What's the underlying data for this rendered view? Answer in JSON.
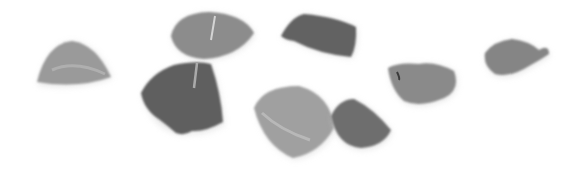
{
  "image": {
    "description": "Grayscale photo of scattered rose petals on a white background",
    "background": "#ffffff",
    "petals": [
      {
        "name": "petal-far-left",
        "tone": "#9a9a9a"
      },
      {
        "name": "petal-top-center",
        "tone": "#8c8c8c"
      },
      {
        "name": "petal-dark-center-left",
        "tone": "#5e5e5e"
      },
      {
        "name": "petal-top-right-dark",
        "tone": "#626262"
      },
      {
        "name": "petal-bottom-center-light",
        "tone": "#a0a0a0"
      },
      {
        "name": "petal-bottom-center-dark",
        "tone": "#6e6e6e"
      },
      {
        "name": "petal-right-middle",
        "tone": "#8a8a8a"
      },
      {
        "name": "petal-far-right",
        "tone": "#858585"
      }
    ]
  }
}
